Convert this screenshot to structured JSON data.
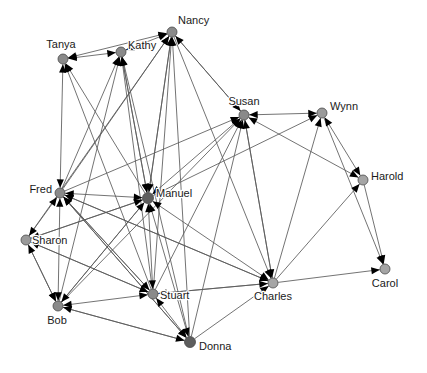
{
  "graph": {
    "title": "Social Network Directed Graph",
    "background_color": "#ffffff",
    "edge_color": "#5a5a5a",
    "arrow_color": "#000000",
    "node_stroke_color": "#4a4a4a",
    "label_color": "#1a1a1a",
    "width": 427,
    "height": 373,
    "nodes": [
      {
        "id": "tanya",
        "label": "Tanya",
        "x": 63,
        "y": 59,
        "r": 5.0,
        "fill": "#8a8a8a",
        "label_dx": -2,
        "label_dy": -14,
        "anchor": "middle"
      },
      {
        "id": "kathy",
        "label": "Kathy",
        "x": 121,
        "y": 52,
        "r": 5.0,
        "fill": "#8a8a8a",
        "label_dx": 7,
        "label_dy": -6,
        "anchor": "start"
      },
      {
        "id": "nancy",
        "label": "Nancy",
        "x": 172,
        "y": 32,
        "r": 5.0,
        "fill": "#8a8a8a",
        "label_dx": 6,
        "label_dy": -11,
        "anchor": "start"
      },
      {
        "id": "susan",
        "label": "Susan",
        "x": 244,
        "y": 115,
        "r": 5.0,
        "fill": "#8a8a8a",
        "label_dx": 0,
        "label_dy": -13,
        "anchor": "middle"
      },
      {
        "id": "wynn",
        "label": "Wynn",
        "x": 322,
        "y": 113,
        "r": 5.0,
        "fill": "#9a9a9a",
        "label_dx": 8,
        "label_dy": -6,
        "anchor": "start"
      },
      {
        "id": "harold",
        "label": "Harold",
        "x": 363,
        "y": 180,
        "r": 5.0,
        "fill": "#a5a5a5",
        "label_dx": 8,
        "label_dy": -3,
        "anchor": "start"
      },
      {
        "id": "fred",
        "label": "Fred",
        "x": 60,
        "y": 193,
        "r": 5.0,
        "fill": "#8a8a8a",
        "label_dx": -8,
        "label_dy": -3,
        "anchor": "end"
      },
      {
        "id": "manuel",
        "label": "Manuel",
        "x": 148,
        "y": 198,
        "r": 5.5,
        "fill": "#5e5e5e",
        "label_dx": 8,
        "label_dy": -4,
        "anchor": "start"
      },
      {
        "id": "sharon",
        "label": "Sharon",
        "x": 26,
        "y": 240,
        "r": 5.0,
        "fill": "#9a9a9a",
        "label_dx": 6,
        "label_dy": 1,
        "anchor": "start"
      },
      {
        "id": "bob",
        "label": "Bob",
        "x": 58,
        "y": 306,
        "r": 5.0,
        "fill": "#8a8a8a",
        "label_dx": -1,
        "label_dy": 15,
        "anchor": "middle"
      },
      {
        "id": "stuart",
        "label": "Stuart",
        "x": 153,
        "y": 294,
        "r": 5.0,
        "fill": "#8a8a8a",
        "label_dx": 7,
        "label_dy": 2,
        "anchor": "start"
      },
      {
        "id": "donna",
        "label": "Donna",
        "x": 190,
        "y": 342,
        "r": 5.5,
        "fill": "#5e5e5e",
        "label_dx": 9,
        "label_dy": 5,
        "anchor": "start"
      },
      {
        "id": "charles",
        "label": "Charles",
        "x": 273,
        "y": 283,
        "r": 5.0,
        "fill": "#a5a5a5",
        "label_dx": 0,
        "label_dy": 14,
        "anchor": "middle"
      },
      {
        "id": "carol",
        "label": "Carol",
        "x": 385,
        "y": 269,
        "r": 5.0,
        "fill": "#a5a5a5",
        "label_dx": 0,
        "label_dy": 15,
        "anchor": "middle"
      }
    ],
    "edges": [
      {
        "from": "tanya",
        "to": "kathy",
        "directed": "both"
      },
      {
        "from": "tanya",
        "to": "nancy",
        "directed": "both"
      },
      {
        "from": "kathy",
        "to": "nancy",
        "directed": "both"
      },
      {
        "from": "fred",
        "to": "tanya",
        "directed": "both"
      },
      {
        "from": "manuel",
        "to": "tanya",
        "directed": "forward"
      },
      {
        "from": "stuart",
        "to": "tanya",
        "directed": "forward"
      },
      {
        "from": "fred",
        "to": "kathy",
        "directed": "forward"
      },
      {
        "from": "manuel",
        "to": "kathy",
        "directed": "both"
      },
      {
        "from": "stuart",
        "to": "kathy",
        "directed": "forward"
      },
      {
        "from": "bob",
        "to": "kathy",
        "directed": "forward"
      },
      {
        "from": "donna",
        "to": "kathy",
        "directed": "forward"
      },
      {
        "from": "fred",
        "to": "nancy",
        "directed": "forward"
      },
      {
        "from": "manuel",
        "to": "nancy",
        "directed": "forward"
      },
      {
        "from": "stuart",
        "to": "nancy",
        "directed": "forward"
      },
      {
        "from": "donna",
        "to": "nancy",
        "directed": "forward"
      },
      {
        "from": "sharon",
        "to": "nancy",
        "directed": "forward"
      },
      {
        "from": "susan",
        "to": "nancy",
        "directed": "forward"
      },
      {
        "from": "susan",
        "to": "wynn",
        "directed": "both"
      },
      {
        "from": "manuel",
        "to": "susan",
        "directed": "both"
      },
      {
        "from": "fred",
        "to": "susan",
        "directed": "forward"
      },
      {
        "from": "stuart",
        "to": "susan",
        "directed": "forward"
      },
      {
        "from": "donna",
        "to": "susan",
        "directed": "forward"
      },
      {
        "from": "charles",
        "to": "susan",
        "directed": "forward"
      },
      {
        "from": "bob",
        "to": "susan",
        "directed": "forward"
      },
      {
        "from": "susan",
        "to": "harold",
        "directed": "both"
      },
      {
        "from": "wynn",
        "to": "harold",
        "directed": "both"
      },
      {
        "from": "charles",
        "to": "wynn",
        "directed": "forward"
      },
      {
        "from": "manuel",
        "to": "wynn",
        "directed": "forward"
      },
      {
        "from": "charles",
        "to": "harold",
        "directed": "forward"
      },
      {
        "from": "wynn",
        "to": "carol",
        "directed": "forward"
      },
      {
        "from": "harold",
        "to": "carol",
        "directed": "forward"
      },
      {
        "from": "charles",
        "to": "carol",
        "directed": "forward"
      },
      {
        "from": "manuel",
        "to": "fred",
        "directed": "both"
      },
      {
        "from": "sharon",
        "to": "fred",
        "directed": "both"
      },
      {
        "from": "bob",
        "to": "fred",
        "directed": "both"
      },
      {
        "from": "stuart",
        "to": "fred",
        "directed": "forward"
      },
      {
        "from": "donna",
        "to": "fred",
        "directed": "forward"
      },
      {
        "from": "charles",
        "to": "fred",
        "directed": "forward"
      },
      {
        "from": "manuel",
        "to": "sharon",
        "directed": "forward"
      },
      {
        "from": "stuart",
        "to": "sharon",
        "directed": "forward"
      },
      {
        "from": "bob",
        "to": "sharon",
        "directed": "both"
      },
      {
        "from": "manuel",
        "to": "stuart",
        "directed": "both"
      },
      {
        "from": "manuel",
        "to": "bob",
        "directed": "forward"
      },
      {
        "from": "manuel",
        "to": "donna",
        "directed": "both"
      },
      {
        "from": "manuel",
        "to": "charles",
        "directed": "both"
      },
      {
        "from": "sharon",
        "to": "bob",
        "directed": "forward"
      },
      {
        "from": "stuart",
        "to": "bob",
        "directed": "both"
      },
      {
        "from": "donna",
        "to": "bob",
        "directed": "forward"
      },
      {
        "from": "stuart",
        "to": "donna",
        "directed": "both"
      },
      {
        "from": "stuart",
        "to": "charles",
        "directed": "forward"
      },
      {
        "from": "donna",
        "to": "charles",
        "directed": "forward"
      },
      {
        "from": "bob",
        "to": "donna",
        "directed": "forward"
      },
      {
        "from": "sharon",
        "to": "stuart",
        "directed": "forward"
      },
      {
        "from": "fred",
        "to": "stuart",
        "directed": "forward"
      },
      {
        "from": "fred",
        "to": "donna",
        "directed": "forward"
      },
      {
        "from": "fred",
        "to": "charles",
        "directed": "forward"
      },
      {
        "from": "sharon",
        "to": "manuel",
        "directed": "forward"
      },
      {
        "from": "bob",
        "to": "manuel",
        "directed": "forward"
      },
      {
        "from": "charles",
        "to": "stuart",
        "directed": "forward"
      },
      {
        "from": "nancy",
        "to": "manuel",
        "directed": "forward"
      },
      {
        "from": "kathy",
        "to": "manuel",
        "directed": "forward"
      },
      {
        "from": "nancy",
        "to": "charles",
        "directed": "forward"
      },
      {
        "from": "susan",
        "to": "charles",
        "directed": "forward"
      },
      {
        "from": "nancy",
        "to": "susan",
        "directed": "forward"
      }
    ]
  }
}
